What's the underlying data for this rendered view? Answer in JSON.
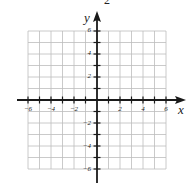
{
  "chart_data": {
    "type": "scatter",
    "title": "",
    "xlabel": "x",
    "ylabel": "y",
    "xlim": [
      -6,
      6
    ],
    "ylim": [
      -6,
      6
    ],
    "grid": true,
    "x_ticks": [
      -6,
      -5,
      -4,
      -3,
      -2,
      -1,
      1,
      2,
      3,
      4,
      5,
      6
    ],
    "y_ticks": [
      -6,
      -5,
      -4,
      -3,
      -2,
      -1,
      1,
      2,
      3,
      4,
      5,
      6
    ],
    "x_tick_labels": [
      "-6",
      "-4",
      "-2",
      "2",
      "4",
      "6"
    ],
    "y_tick_labels": [
      "6",
      "4",
      "2",
      "-2",
      "-4",
      "-6"
    ],
    "series": [],
    "annotations": [
      "2"
    ]
  },
  "labels": {
    "x_axis": "x",
    "y_axis": "y",
    "top_partial": "2",
    "xt": [
      "−6",
      "−4",
      "−2",
      "2",
      "4",
      "6"
    ],
    "yt": [
      "6",
      "4",
      "2",
      "−2",
      "−4",
      "−6"
    ]
  },
  "colors": {
    "grid": "#bdbdbd",
    "axis": "#1a1a1a"
  }
}
